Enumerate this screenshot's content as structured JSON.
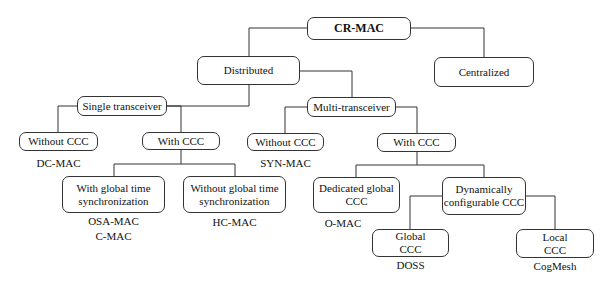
{
  "diagram": {
    "root": "CR-MAC",
    "nodes": {
      "distributed": "Distributed",
      "centralized": "Centralized",
      "single_transceiver": "Single transceiver",
      "multi_transceiver": "Multi-transceiver",
      "st_without_ccc": "Without CCC",
      "st_with_ccc": "With CCC",
      "mt_without_ccc": "Without CCC",
      "mt_with_ccc": "With CCC",
      "with_global_time_1": "With global time",
      "with_global_time_2": "synchronization",
      "without_global_time_1": "Without global time",
      "without_global_time_2": "synchronization",
      "dedicated_global_1": "Dedicated global",
      "dedicated_global_2": "CCC",
      "dynamic_1": "Dynamically",
      "dynamic_2": "configurable CCC",
      "global_ccc_1": "Global",
      "global_ccc_2": "CCC",
      "local_ccc_1": "Local",
      "local_ccc_2": "CCC"
    },
    "protocols": {
      "dc_mac": "DC-MAC",
      "syn_mac": "SYN-MAC",
      "osa_mac": "OSA-MAC",
      "c_mac": "C-MAC",
      "hc_mac": "HC-MAC",
      "o_mac": "O-MAC",
      "doss": "DOSS",
      "cogmesh": "CogMesh"
    }
  }
}
